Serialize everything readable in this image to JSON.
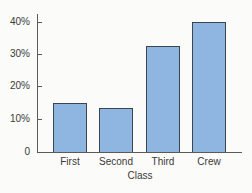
{
  "chart_data": {
    "type": "bar",
    "title": "",
    "xlabel": "Class",
    "ylabel": "",
    "categories": [
      "First",
      "Second",
      "Third",
      "Crew"
    ],
    "values": [
      15,
      13.5,
      32.5,
      40
    ],
    "unit": "%",
    "ylim": [
      0,
      40
    ],
    "yticks": [
      "0",
      "10%",
      "20%",
      "30%",
      "40%"
    ],
    "grid": false,
    "legend": null,
    "bar_color": "#8fb6e0",
    "bar_edge_color": "#3a4550"
  }
}
